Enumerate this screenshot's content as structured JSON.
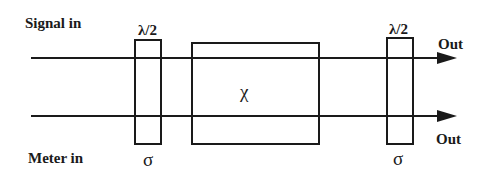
{
  "diagram": {
    "inputs": {
      "signal": "Signal in",
      "meter": "Meter in"
    },
    "outputs": {
      "top": "Out",
      "bottom": "Out"
    },
    "left_element": {
      "top_label": "λ/2",
      "bottom_label": "σ"
    },
    "center_element": {
      "label": "χ"
    },
    "right_element": {
      "top_label": "λ/2",
      "bottom_label": "σ"
    },
    "colors": {
      "stroke": "#1a1a1a",
      "background": "#ffffff"
    }
  }
}
